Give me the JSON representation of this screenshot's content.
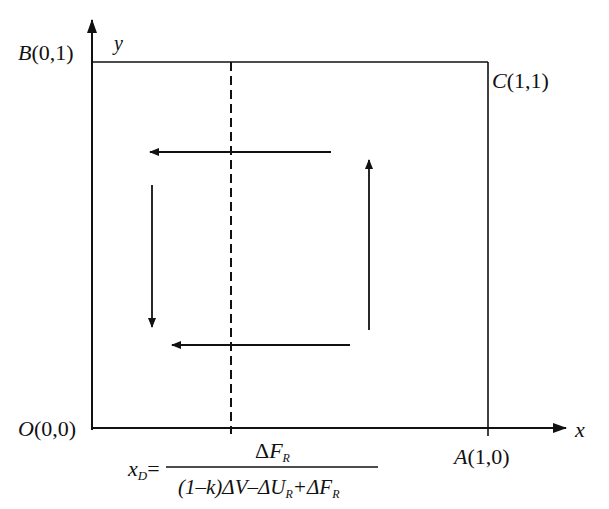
{
  "diagram": {
    "type": "phase-diagram",
    "axes": {
      "x_label": "x",
      "y_label": "y"
    },
    "points": {
      "origin": {
        "letter": "O",
        "coords": "(0,0)"
      },
      "A": {
        "letter": "A",
        "coords": "(1,0)"
      },
      "B": {
        "letter": "B",
        "coords": "(0,1)"
      },
      "C": {
        "letter": "C",
        "coords": "(1,1)"
      }
    },
    "threshold": {
      "lhs_var": "x",
      "lhs_sub": "D",
      "equals": "=",
      "numerator": {
        "delta": "Δ",
        "var": "F",
        "sub": "R"
      },
      "denominator": {
        "part1": "(1–k)",
        "part2": "ΔV–ΔU",
        "sub1": "R",
        "part3": "+ΔF",
        "sub2": "R"
      }
    },
    "arrows": [
      {
        "name": "top-left-arrow",
        "direction": "left"
      },
      {
        "name": "left-down-arrow",
        "direction": "down"
      },
      {
        "name": "bottom-left-arrow",
        "direction": "left"
      },
      {
        "name": "right-up-arrow",
        "direction": "up"
      }
    ],
    "colors": {
      "line": "#111111",
      "background": "#ffffff"
    }
  }
}
